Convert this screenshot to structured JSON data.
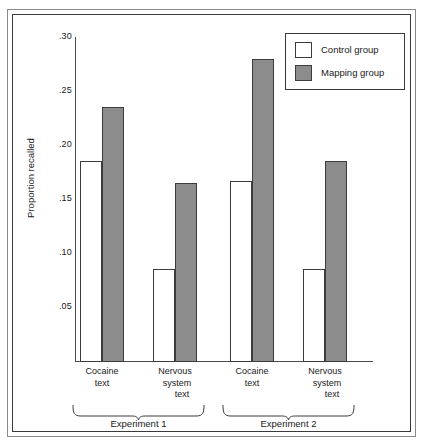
{
  "figure": {
    "frame_color": "#3a3a3a",
    "background": "#ffffff"
  },
  "legend": {
    "position": "top-right",
    "entries": [
      {
        "label": "Control group",
        "swatch": "white-square-icon",
        "color": "#ffffff"
      },
      {
        "label": "Mapping group",
        "swatch": "gray-square-icon",
        "color": "#8c8c8c"
      }
    ]
  },
  "groups": [
    {
      "name": "Experiment 1",
      "brace_label": "Experiment 1"
    },
    {
      "name": "Experiment 2",
      "brace_label": "Experiment 2"
    }
  ],
  "category_labels": [
    {
      "lines": [
        "Cocaine",
        "text"
      ]
    },
    {
      "lines": [
        "Nervous",
        "system",
        "text"
      ]
    },
    {
      "lines": [
        "Cocaine",
        "text"
      ]
    },
    {
      "lines": [
        "Nervous",
        "system",
        "text"
      ]
    }
  ],
  "chart_data": {
    "type": "bar",
    "title": "",
    "subtitle": "",
    "xlabel": "",
    "ylabel": "Proportion recalled",
    "ylim": [
      0,
      0.3
    ],
    "yticks": [
      0.3,
      0.25,
      0.2,
      0.15,
      0.1,
      0.05
    ],
    "ytick_labels": [
      ".30",
      ".25",
      ".20",
      ".15",
      ".10",
      ".05"
    ],
    "grid": false,
    "legend_position": "top-right",
    "categories": [
      "Cocaine text (Experiment 1)",
      "Nervous system text (Experiment 1)",
      "Cocaine text (Experiment 2)",
      "Nervous system text (Experiment 2)"
    ],
    "group_spans": [
      {
        "label": "Experiment 1",
        "categories": [
          0,
          1
        ]
      },
      {
        "label": "Experiment 2",
        "categories": [
          2,
          3
        ]
      }
    ],
    "series": [
      {
        "name": "Control group",
        "color": "#ffffff",
        "values": [
          0.185,
          0.085,
          0.167,
          0.085
        ]
      },
      {
        "name": "Mapping group",
        "color": "#8c8c8c",
        "values": [
          0.235,
          0.165,
          0.28,
          0.185
        ]
      }
    ],
    "annotations": []
  }
}
